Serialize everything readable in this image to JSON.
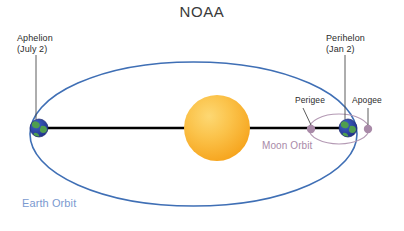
{
  "title": "NOAA",
  "labels": {
    "aphelion_name": "Aphelion",
    "aphelion_date": "(July 2)",
    "perihelion_name": "Perihelon",
    "perihelion_date": "(Jan 2)",
    "perigee": "Perigee",
    "apogee": "Apogee",
    "moon_orbit": "Moon Orbit",
    "earth_orbit": "Earth Orbit"
  },
  "colors": {
    "earth_orbit_line": "#3f6fb5",
    "earth_orbit_text": "#7b9ad0",
    "moon_orbit_line": "#b49ab4",
    "moon_orbit_text": "#a98aa8",
    "moon_dot": "#a98aa8",
    "sun_outer": "#f5a623",
    "sun_inner": "#fdd064",
    "earth_ocean": "#2b3f9e",
    "earth_land": "#4f9e4f",
    "axis_line": "#000000",
    "leader_line": "#4a4a4a",
    "title_text": "#3a3a3a",
    "body_text": "#2b2b2b",
    "background": "#ffffff"
  },
  "geometry": {
    "earth_orbit_ellipse": {
      "cx": 193.5,
      "cy": 134,
      "rx": 163.5,
      "ry": 72
    },
    "sun": {
      "cx": 217,
      "cy": 128,
      "r": 33
    },
    "earth_aphelion": {
      "cx": 39,
      "cy": 128,
      "r": 9
    },
    "earth_perihelion": {
      "cx": 348,
      "cy": 128,
      "r": 9
    },
    "moon_orbit_ellipse": {
      "cx": 339,
      "cy": 129,
      "rx": 30,
      "ry": 15
    },
    "moon_perigee": {
      "cx": 311,
      "cy": 129,
      "r": 4
    },
    "moon_apogee": {
      "cx": 368,
      "cy": 129,
      "r": 4
    },
    "major_axis": {
      "x1": 39,
      "y1": 128,
      "x2": 348,
      "y2": 128
    }
  }
}
